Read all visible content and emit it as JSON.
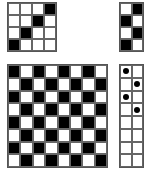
{
  "colors": {
    "filled": "#000000",
    "empty": "#ffffff",
    "gridline": "#555555"
  },
  "grids": {
    "top_left": {
      "rows": 4,
      "cols": 4,
      "cells": [
        [
          0,
          0,
          0,
          1
        ],
        [
          0,
          0,
          1,
          0
        ],
        [
          0,
          1,
          0,
          0
        ],
        [
          1,
          0,
          0,
          0
        ]
      ]
    },
    "top_right": {
      "rows": 4,
      "cols": 2,
      "cells": [
        [
          0,
          1
        ],
        [
          1,
          0
        ],
        [
          0,
          1
        ],
        [
          1,
          0
        ]
      ]
    },
    "bottom_left": {
      "rows": 8,
      "cols": 8,
      "pattern": "checkerboard",
      "top_left_filled": true,
      "cells": [
        [
          1,
          0,
          1,
          0,
          1,
          0,
          1,
          0
        ],
        [
          0,
          1,
          0,
          1,
          0,
          1,
          0,
          1
        ],
        [
          1,
          0,
          1,
          0,
          1,
          0,
          1,
          0
        ],
        [
          0,
          1,
          0,
          1,
          0,
          1,
          0,
          1
        ],
        [
          1,
          0,
          1,
          0,
          1,
          0,
          1,
          0
        ],
        [
          0,
          1,
          0,
          1,
          0,
          1,
          0,
          1
        ],
        [
          1,
          0,
          1,
          0,
          1,
          0,
          1,
          0
        ],
        [
          0,
          1,
          0,
          1,
          0,
          1,
          0,
          1
        ]
      ]
    },
    "bottom_right": {
      "rows": 8,
      "cols": 2,
      "dots": [
        [
          1,
          0
        ],
        [
          0,
          1
        ],
        [
          1,
          0
        ],
        [
          0,
          1
        ],
        [
          0,
          0
        ],
        [
          0,
          0
        ],
        [
          0,
          0
        ],
        [
          0,
          0
        ]
      ]
    }
  }
}
